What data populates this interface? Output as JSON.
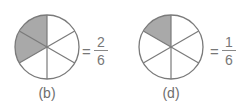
{
  "figures": [
    {
      "id": "b",
      "label": "(b)",
      "total_parts": 6,
      "shaded_parts": 2,
      "equals": "=",
      "numerator": "2",
      "denominator": "6"
    },
    {
      "id": "d",
      "label": "(d)",
      "total_parts": 6,
      "shaded_parts": 1,
      "equals": "=",
      "numerator": "1",
      "denominator": "6"
    }
  ],
  "colors": {
    "shaded": "#a9a9a9",
    "outline": "#7a7a7a",
    "unshaded": "#ffffff"
  }
}
